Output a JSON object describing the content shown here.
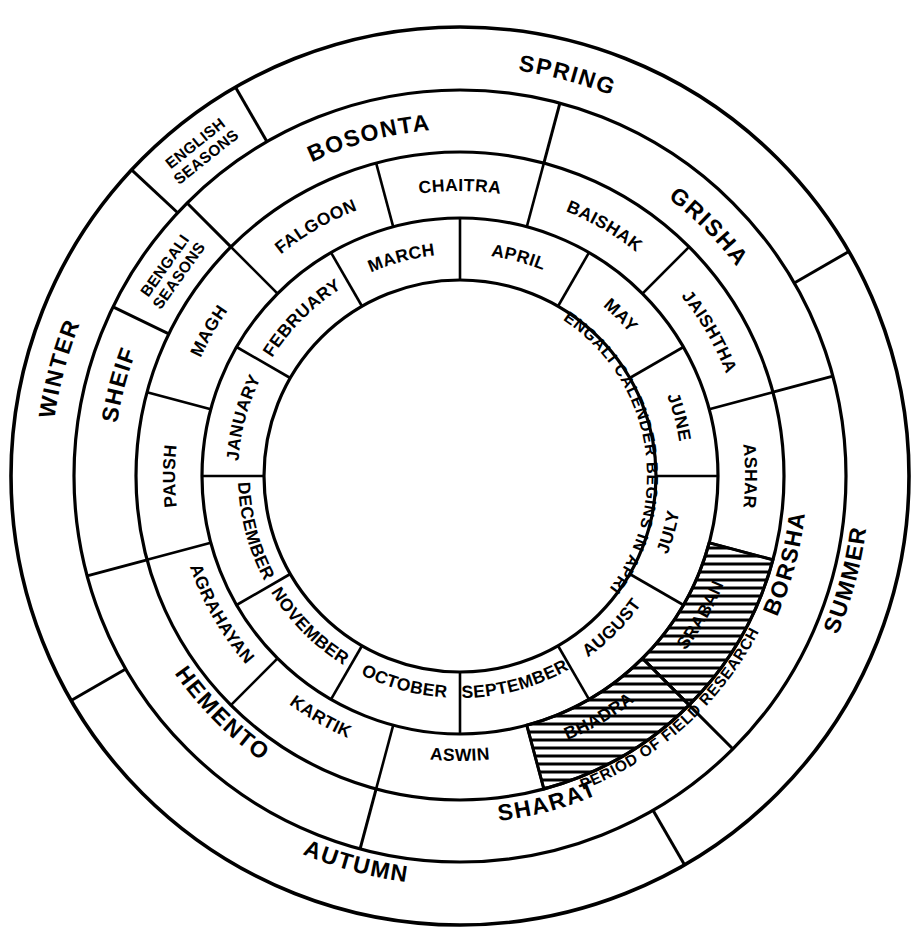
{
  "diagram": {
    "center": {
      "x": 460,
      "y": 476
    },
    "radii": {
      "inner": 196,
      "months": 258,
      "bengali_months": 324,
      "bengali_seasons": 386,
      "english_seasons": 449
    },
    "center_note": "BENGALI CALENDER BEGINS IN APRIL",
    "colors": {
      "line": "#000000",
      "background": "#ffffff",
      "hatch": "#000000"
    }
  },
  "keys": {
    "english_seasons_label": "ENGLISH SEASONS",
    "bengali_seasons_label": "BENGALI SEASONS",
    "field_research_label": "PERIOD OF FIELD RESEARCH"
  },
  "english_months": [
    {
      "label": "APRIL",
      "start_deg": 0,
      "end_deg": 30
    },
    {
      "label": "MAY",
      "start_deg": 30,
      "end_deg": 60
    },
    {
      "label": "JUNE",
      "start_deg": 60,
      "end_deg": 90
    },
    {
      "label": "JULY",
      "start_deg": 90,
      "end_deg": 120
    },
    {
      "label": "AUGUST",
      "start_deg": 120,
      "end_deg": 150
    },
    {
      "label": "SEPTEMBER",
      "start_deg": 150,
      "end_deg": 180
    },
    {
      "label": "OCTOBER",
      "start_deg": 180,
      "end_deg": 210
    },
    {
      "label": "NOVEMBER",
      "start_deg": 210,
      "end_deg": 240
    },
    {
      "label": "DECEMBER",
      "start_deg": 240,
      "end_deg": 270
    },
    {
      "label": "JANUARY",
      "start_deg": 270,
      "end_deg": 300
    },
    {
      "label": "FEBRUARY",
      "start_deg": 300,
      "end_deg": 330
    },
    {
      "label": "MARCH",
      "start_deg": 330,
      "end_deg": 360
    }
  ],
  "bengali_months": [
    {
      "label": "CHAITRA",
      "start_deg": -15,
      "end_deg": 15,
      "hatched": false
    },
    {
      "label": "BAISHAK",
      "start_deg": 15,
      "end_deg": 45,
      "hatched": false
    },
    {
      "label": "JAISHTHA",
      "start_deg": 45,
      "end_deg": 75,
      "hatched": false
    },
    {
      "label": "ASHAR",
      "start_deg": 75,
      "end_deg": 105,
      "hatched": false
    },
    {
      "label": "SRABAN",
      "start_deg": 105,
      "end_deg": 135,
      "hatched": true
    },
    {
      "label": "BHADRA",
      "start_deg": 135,
      "end_deg": 165,
      "hatched": true
    },
    {
      "label": "ASWIN",
      "start_deg": 165,
      "end_deg": 195,
      "hatched": false
    },
    {
      "label": "KARTIK",
      "start_deg": 195,
      "end_deg": 225,
      "hatched": false
    },
    {
      "label": "AGRAHAYAN",
      "start_deg": 225,
      "end_deg": 255,
      "hatched": false
    },
    {
      "label": "PAUSH",
      "start_deg": 255,
      "end_deg": 285,
      "hatched": false
    },
    {
      "label": "MAGH",
      "start_deg": 285,
      "end_deg": 315,
      "hatched": false
    },
    {
      "label": "FALGOON",
      "start_deg": 315,
      "end_deg": 345,
      "hatched": false
    }
  ],
  "bengali_seasons": [
    {
      "label": "BOSONTA",
      "start_deg": -45,
      "end_deg": 15
    },
    {
      "label": "GRISHA",
      "start_deg": 15,
      "end_deg": 75
    },
    {
      "label": "BORSHA",
      "start_deg": 75,
      "end_deg": 135
    },
    {
      "label": "SHARAT",
      "start_deg": 135,
      "end_deg": 195
    },
    {
      "label": "HEMENTO",
      "start_deg": 195,
      "end_deg": 255
    },
    {
      "label": "SHEIF",
      "start_deg": 255,
      "end_deg": 315
    }
  ],
  "english_seasons": [
    {
      "label": "SPRING",
      "start_deg": -30,
      "end_deg": 60
    },
    {
      "label": "SUMMER",
      "start_deg": 60,
      "end_deg": 150
    },
    {
      "label": "AUTUMN",
      "start_deg": 150,
      "end_deg": 240
    },
    {
      "label": "WINTER",
      "start_deg": 240,
      "end_deg": 330
    }
  ],
  "chart_data": {
    "type": "pie",
    "rings": [
      {
        "name": "english_months",
        "count": 12,
        "slice_deg": 30
      },
      {
        "name": "bengali_months",
        "count": 12,
        "slice_deg": 30,
        "offset_deg": -15
      },
      {
        "name": "bengali_seasons",
        "count": 6,
        "slice_deg": 60,
        "offset_deg": -45
      },
      {
        "name": "english_seasons",
        "count": 4,
        "slice_deg": 90,
        "offset_deg": -30
      }
    ],
    "highlight": {
      "label": "PERIOD OF FIELD RESEARCH",
      "months": [
        "SRABAN",
        "BHADRA"
      ],
      "start_deg": 105,
      "end_deg": 165
    }
  }
}
